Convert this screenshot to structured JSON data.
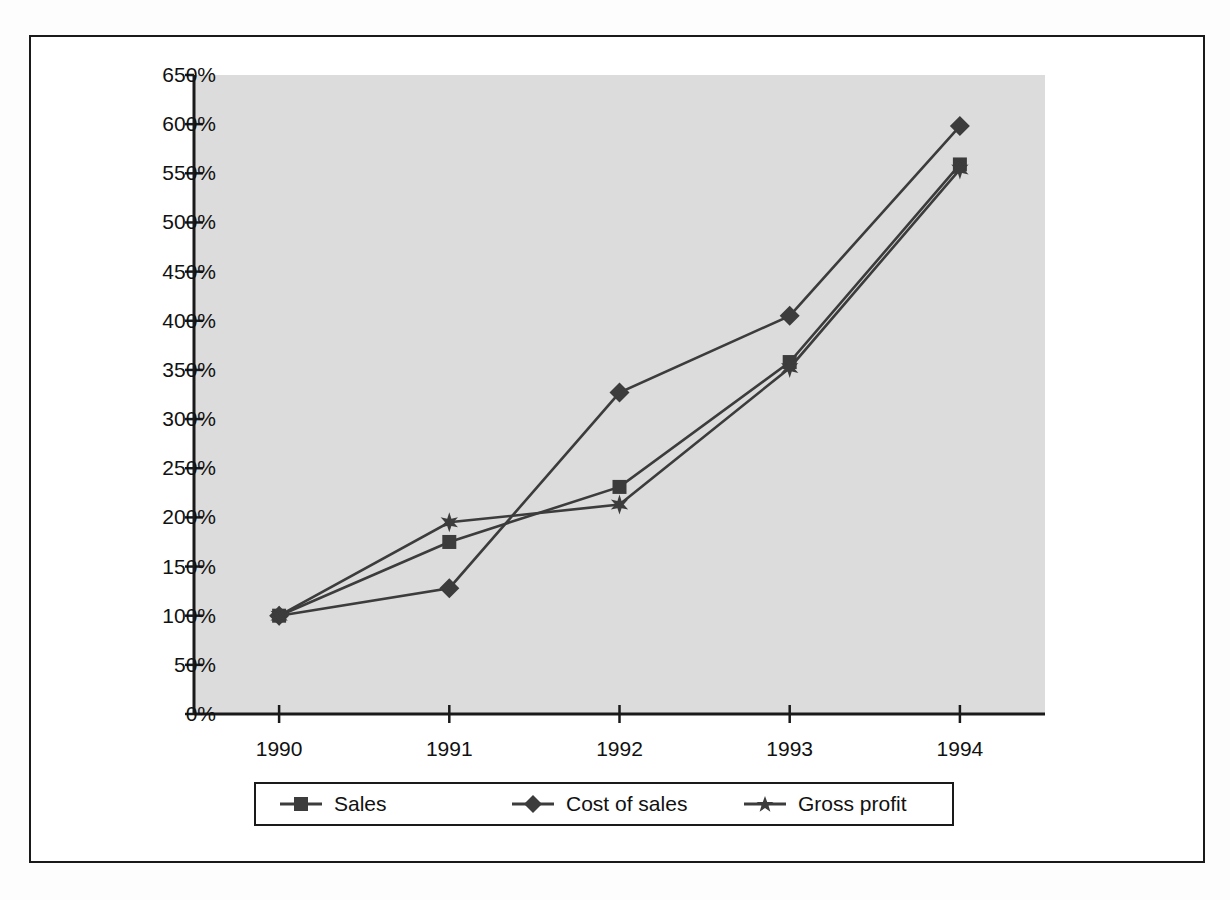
{
  "chart_data": {
    "type": "line",
    "title": "",
    "subtitle": "",
    "xlabel": "",
    "ylabel": "",
    "categories": [
      "1990",
      "1991",
      "1992",
      "1993",
      "1994"
    ],
    "x": [
      1990,
      1991,
      1992,
      1993,
      1994
    ],
    "series": [
      {
        "name": "Sales",
        "marker": "square",
        "color": "#3c3c3c",
        "values": [
          100,
          175,
          231,
          358,
          559
        ]
      },
      {
        "name": "Cost of sales",
        "marker": "diamond",
        "color": "#3c3c3c",
        "values": [
          100,
          128,
          327,
          405,
          598
        ]
      },
      {
        "name": "Gross profit",
        "marker": "star",
        "color": "#3c3c3c",
        "values": [
          100,
          195,
          213,
          352,
          554
        ]
      }
    ],
    "ylim": [
      0,
      650
    ],
    "y_ticks": [
      0,
      50,
      100,
      150,
      200,
      250,
      300,
      350,
      400,
      450,
      500,
      550,
      600,
      650
    ],
    "y_tick_labels": [
      "0%",
      "50%",
      "100%",
      "150%",
      "200%",
      "250%",
      "300%",
      "350%",
      "400%",
      "450%",
      "500%",
      "550%",
      "600%",
      "650%"
    ],
    "x_tick_labels": [
      "1990",
      "1991",
      "1992",
      "1993",
      "1994"
    ],
    "grid": false,
    "legend_position": "bottom",
    "plot_background": "#dcdcdc",
    "axis_color": "#1a1a1a",
    "line_color": "#3c3c3c"
  },
  "legend": {
    "entries": [
      {
        "label": "Sales",
        "marker": "square-marker-icon"
      },
      {
        "label": "Cost of sales",
        "marker": "diamond-marker-icon"
      },
      {
        "label": "Gross profit",
        "marker": "star-marker-icon"
      }
    ]
  }
}
